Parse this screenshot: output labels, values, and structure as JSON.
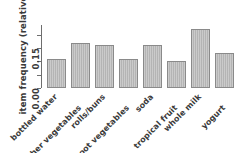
{
  "chart_data": {
    "type": "bar",
    "title": "",
    "subtitle": "",
    "xlabel": "",
    "ylabel": "item frequency (relative)",
    "categories": [
      "bottled water",
      "other vegetables",
      "rolls/buns",
      "root vegetables",
      "soda",
      "tropical fruit",
      "whole milk",
      "yogurt"
    ],
    "values": [
      0.11,
      0.17,
      0.16,
      0.11,
      0.16,
      0.1,
      0.22,
      0.13
    ],
    "ylim": [
      0.0,
      0.2362
    ],
    "yticks": [
      0.0,
      0.05,
      0.1,
      0.15,
      0.2
    ],
    "ytick_labels_shown": [
      "0.00",
      "0.15"
    ],
    "grid": false,
    "legend": null,
    "bar_fill": "#b4b4b4",
    "bar_border": "#8a8a8a",
    "axis_color": "#6e6e6e",
    "text_color": "#3a3a3a",
    "background": "#ffffff",
    "xlabel_rotation_deg": -45,
    "xlabel_stagger": true
  }
}
